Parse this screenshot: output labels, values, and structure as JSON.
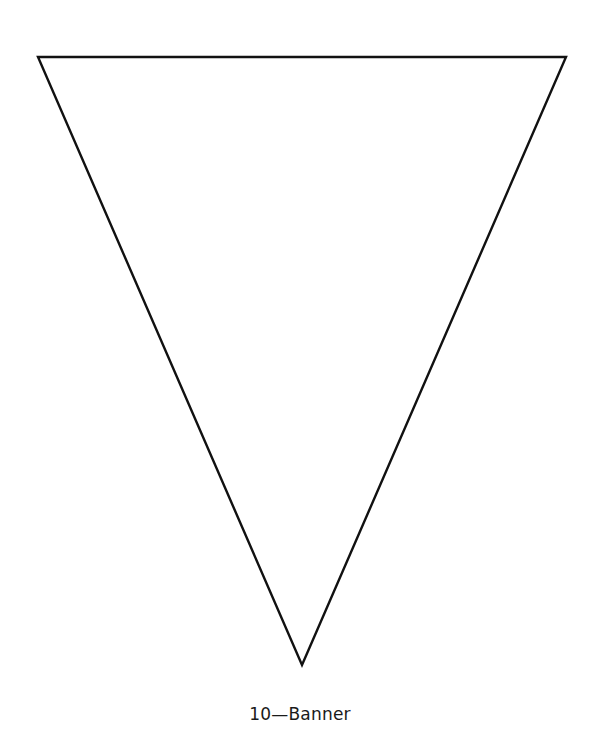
{
  "figure": {
    "shape": "inverted-triangle-pennant",
    "stroke_color": "#111111",
    "fill_color": "#ffffff",
    "stroke_width": 2.4,
    "vertices": {
      "top_left": [
        38,
        57
      ],
      "top_right": [
        566,
        57
      ],
      "bottom": [
        302,
        665
      ]
    }
  },
  "caption": {
    "text": "10—Banner"
  }
}
